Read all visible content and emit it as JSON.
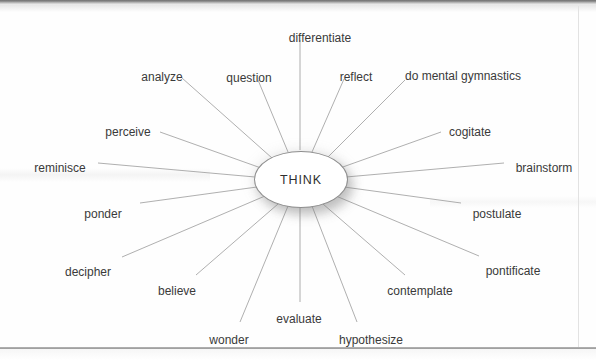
{
  "diagram": {
    "type": "radial-word-web",
    "center": {
      "label": "THINK",
      "shape": "ellipse"
    },
    "line_color": "#9a9a9a",
    "text_color": "#3a3a3a",
    "background_color": "#fefefe",
    "spokes": [
      {
        "label": "differentiate",
        "label_x": 320,
        "label_y": 32,
        "anchor": "anchor-mid",
        "line_x1": 300,
        "line_y1": 150,
        "line_x2": 300,
        "line_y2": 40
      },
      {
        "label": "question",
        "label_x": 249,
        "label_y": 72,
        "anchor": "anchor-mid",
        "line_x1": 288,
        "line_y1": 152,
        "line_x2": 258,
        "line_y2": 80
      },
      {
        "label": "reflect",
        "label_x": 356,
        "label_y": 71,
        "anchor": "anchor-mid",
        "line_x1": 312,
        "line_y1": 152,
        "line_x2": 344,
        "line_y2": 79
      },
      {
        "label": "analyze",
        "label_x": 162,
        "label_y": 71,
        "anchor": "anchor-mid",
        "line_x1": 272,
        "line_y1": 158,
        "line_x2": 182,
        "line_y2": 78
      },
      {
        "label": "do mental gymnastics",
        "label_x": 463,
        "label_y": 70,
        "anchor": "anchor-mid",
        "line_x1": 325,
        "line_y1": 160,
        "line_x2": 405,
        "line_y2": 80
      },
      {
        "label": "perceive",
        "label_x": 128,
        "label_y": 126,
        "anchor": "anchor-mid",
        "line_x1": 261,
        "line_y1": 168,
        "line_x2": 160,
        "line_y2": 132
      },
      {
        "label": "cogitate",
        "label_x": 470,
        "label_y": 126,
        "anchor": "anchor-mid",
        "line_x1": 340,
        "line_y1": 168,
        "line_x2": 441,
        "line_y2": 132
      },
      {
        "label": "reminisce",
        "label_x": 60,
        "label_y": 162,
        "anchor": "anchor-mid",
        "line_x1": 255,
        "line_y1": 177,
        "line_x2": 98,
        "line_y2": 163
      },
      {
        "label": "brainstorm",
        "label_x": 544,
        "label_y": 162,
        "anchor": "anchor-mid",
        "line_x1": 346,
        "line_y1": 177,
        "line_x2": 504,
        "line_y2": 163
      },
      {
        "label": "ponder",
        "label_x": 103,
        "label_y": 208,
        "anchor": "anchor-mid",
        "line_x1": 257,
        "line_y1": 187,
        "line_x2": 140,
        "line_y2": 203
      },
      {
        "label": "postulate",
        "label_x": 497,
        "label_y": 208,
        "anchor": "anchor-mid",
        "line_x1": 344,
        "line_y1": 187,
        "line_x2": 461,
        "line_y2": 203
      },
      {
        "label": "decipher",
        "label_x": 88,
        "label_y": 266,
        "anchor": "anchor-mid",
        "line_x1": 265,
        "line_y1": 196,
        "line_x2": 122,
        "line_y2": 257
      },
      {
        "label": "pontificate",
        "label_x": 513,
        "label_y": 265,
        "anchor": "anchor-mid",
        "line_x1": 336,
        "line_y1": 196,
        "line_x2": 479,
        "line_y2": 256
      },
      {
        "label": "believe",
        "label_x": 177,
        "label_y": 285,
        "anchor": "anchor-mid",
        "line_x1": 278,
        "line_y1": 204,
        "line_x2": 196,
        "line_y2": 275
      },
      {
        "label": "contemplate",
        "label_x": 420,
        "label_y": 285,
        "anchor": "anchor-mid",
        "line_x1": 323,
        "line_y1": 204,
        "line_x2": 405,
        "line_y2": 275
      },
      {
        "label": "evaluate",
        "label_x": 299,
        "label_y": 313,
        "anchor": "anchor-mid",
        "line_x1": 300,
        "line_y1": 207,
        "line_x2": 300,
        "line_y2": 302
      },
      {
        "label": "wonder",
        "label_x": 229,
        "label_y": 334,
        "anchor": "anchor-mid",
        "line_x1": 288,
        "line_y1": 206,
        "line_x2": 240,
        "line_y2": 322
      },
      {
        "label": "hypothesize",
        "label_x": 371,
        "label_y": 334,
        "anchor": "anchor-mid",
        "line_x1": 312,
        "line_y1": 206,
        "line_x2": 357,
        "line_y2": 322
      }
    ]
  }
}
